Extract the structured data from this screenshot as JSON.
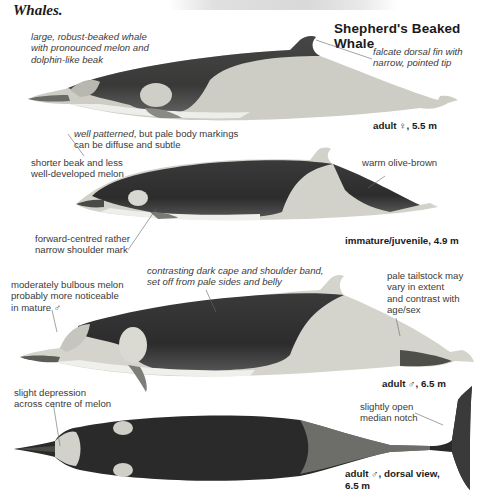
{
  "page": {
    "previous_section_tail": "Whales.",
    "title": "Shepherd's Beaked Whale"
  },
  "figures": [
    {
      "id": "adult-female",
      "caption": "adult ♀, 5.5 m",
      "annotations": [
        {
          "text_lines": [
            "large, robust-beaked whale",
            "with pronounced melon and",
            "dolphin-like beak"
          ],
          "style": "italic"
        },
        {
          "text_lines": [
            "falcate dorsal fin with",
            "narrow, pointed tip"
          ],
          "style": "italic"
        },
        {
          "text_lines": [
            "well patterned, but pale body markings",
            "can be diffuse and subtle"
          ],
          "style": "mixed",
          "italic_part": "well patterned",
          "rest": ", but pale body markings"
        }
      ]
    },
    {
      "id": "immature-juvenile",
      "caption": "immature/juvenile, 4.9 m",
      "annotations": [
        {
          "text_lines": [
            "shorter beak and less",
            "well-developed melon"
          ],
          "style": "normal"
        },
        {
          "text_lines": [
            "warm olive-brown"
          ],
          "style": "normal"
        },
        {
          "text_lines": [
            "forward-centred rather",
            "narrow shoulder mark"
          ],
          "style": "normal"
        }
      ]
    },
    {
      "id": "adult-male",
      "caption": "adult ♂, 6.5 m",
      "annotations": [
        {
          "text_lines": [
            "moderately bulbous melon",
            "probably more noticeable",
            "in mature ♂"
          ],
          "style": "normal"
        },
        {
          "text_lines": [
            "contrasting dark cape and shoulder band,",
            "set off from pale sides and belly"
          ],
          "style": "italic"
        },
        {
          "text_lines": [
            "pale tailstock may",
            "vary in extent",
            "and contrast with",
            "age/sex"
          ],
          "style": "normal"
        }
      ]
    },
    {
      "id": "adult-male-dorsal",
      "caption_lines": [
        "adult ♂, dorsal view,",
        "6.5 m"
      ],
      "annotations": [
        {
          "text_lines": [
            "slight depression",
            "across centre of melon"
          ],
          "style": "normal"
        },
        {
          "text_lines": [
            "slightly open",
            "median notch"
          ],
          "style": "normal"
        }
      ]
    }
  ],
  "colors": {
    "dark_cape": "#2e2e2e",
    "pale_body": "#d6d6d0",
    "belly": "#ececea",
    "text": "#3a3a3a"
  }
}
